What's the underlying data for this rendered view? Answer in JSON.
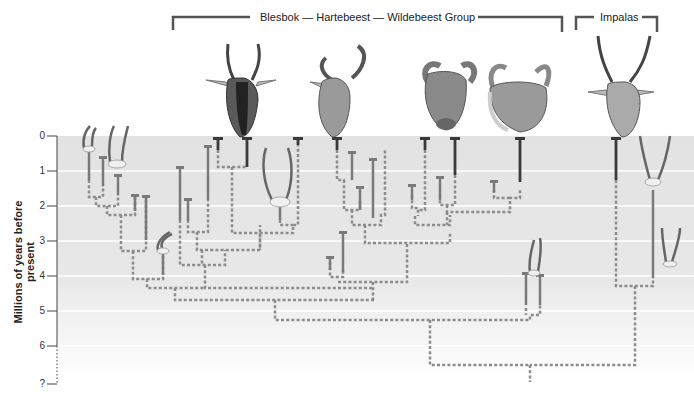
{
  "diagram": {
    "type": "phylogenetic-tree",
    "groups": [
      {
        "label": "Blesbok — Hartebeest — Wildebeest Group"
      },
      {
        "label": "Impalas"
      }
    ],
    "axis": {
      "title": "Millions of years before present",
      "ticks": [
        "0",
        "1",
        "2",
        "3",
        "4",
        "5",
        "6",
        "?"
      ]
    },
    "illustrations": [
      {
        "name": "blesbok-head"
      },
      {
        "name": "hartebeest-head"
      },
      {
        "name": "black-wildebeest-head"
      },
      {
        "name": "blue-wildebeest-head"
      },
      {
        "name": "impala-head"
      },
      {
        "name": "fossil-horn-cores"
      }
    ],
    "colors": {
      "band_light": "#e6e6e6",
      "band_dark": "#dcdcdc",
      "extant_lineage": "#3a3a3a",
      "fossil_lineage": "#7a7a7a",
      "inferred_link": "#8c8c8c"
    }
  }
}
